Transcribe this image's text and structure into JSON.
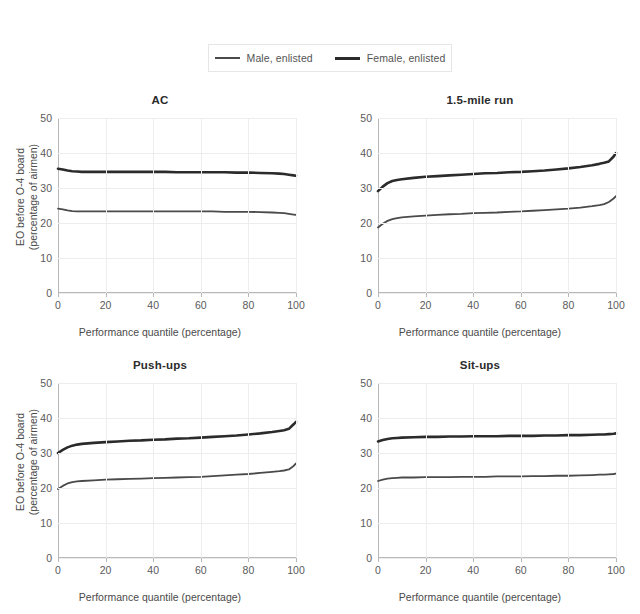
{
  "figure": {
    "background_color": "#ffffff",
    "legend": {
      "position": "top-center",
      "entries": [
        {
          "label": "Male, enlisted",
          "color": "#4a4a4a",
          "swatch": "line-swatch-male",
          "linewidth": 2
        },
        {
          "label": "Female, enlisted",
          "color": "#2b2b2b",
          "swatch": "line-swatch-female",
          "linewidth": 3
        }
      ]
    }
  },
  "chart_data": [
    {
      "type": "line",
      "title": "AC",
      "xlabel": "Performance quantile (percentage)",
      "ylabel": "EO before O-4 board\n(percentage of airmen)",
      "ylabel_line1": "EO before O-4 board",
      "ylabel_line2": "(percentage of airmen)",
      "xlim": [
        0,
        100
      ],
      "ylim": [
        0,
        50
      ],
      "xticks": [
        0,
        20,
        40,
        60,
        80,
        100
      ],
      "yticks": [
        0,
        10,
        20,
        30,
        40,
        50
      ],
      "grid": true,
      "x": [
        0,
        2,
        4,
        6,
        8,
        10,
        15,
        20,
        25,
        30,
        35,
        40,
        45,
        50,
        55,
        60,
        65,
        70,
        75,
        80,
        85,
        90,
        93,
        95,
        97,
        99,
        100
      ],
      "series": [
        {
          "name": "Male, enlisted",
          "color": "#4a4a4a",
          "values": [
            24.1,
            23.9,
            23.6,
            23.4,
            23.3,
            23.3,
            23.3,
            23.3,
            23.3,
            23.3,
            23.3,
            23.3,
            23.3,
            23.3,
            23.3,
            23.3,
            23.3,
            23.2,
            23.2,
            23.2,
            23.1,
            23.0,
            22.9,
            22.8,
            22.6,
            22.4,
            22.3
          ]
        },
        {
          "name": "Female, enlisted",
          "color": "#2b2b2b",
          "values": [
            35.5,
            35.3,
            35.0,
            34.8,
            34.7,
            34.6,
            34.6,
            34.6,
            34.6,
            34.6,
            34.6,
            34.6,
            34.6,
            34.5,
            34.5,
            34.5,
            34.5,
            34.5,
            34.4,
            34.4,
            34.3,
            34.2,
            34.1,
            34.0,
            33.8,
            33.6,
            33.5
          ]
        }
      ]
    },
    {
      "type": "line",
      "title": "1.5-mile run",
      "xlabel": "Performance quantile (percentage)",
      "ylabel": "EO before O-4 board\n(percentage of airmen)",
      "ylabel_line1": "EO before O-4 board",
      "ylabel_line2": "(percentage of airmen)",
      "xlim": [
        0,
        100
      ],
      "ylim": [
        0,
        50
      ],
      "xticks": [
        0,
        20,
        40,
        60,
        80,
        100
      ],
      "yticks": [
        0,
        10,
        20,
        30,
        40,
        50
      ],
      "grid": true,
      "x": [
        0,
        2,
        4,
        6,
        8,
        10,
        15,
        20,
        25,
        30,
        35,
        40,
        45,
        50,
        55,
        60,
        65,
        70,
        75,
        80,
        85,
        90,
        93,
        95,
        97,
        99,
        100
      ],
      "series": [
        {
          "name": "Male, enlisted",
          "color": "#4a4a4a",
          "values": [
            18.7,
            19.8,
            20.6,
            21.1,
            21.4,
            21.6,
            21.9,
            22.1,
            22.3,
            22.5,
            22.6,
            22.8,
            22.9,
            23.0,
            23.2,
            23.3,
            23.5,
            23.7,
            23.9,
            24.1,
            24.4,
            24.8,
            25.1,
            25.4,
            26.0,
            27.0,
            27.7
          ]
        },
        {
          "name": "Female, enlisted",
          "color": "#2b2b2b",
          "values": [
            29.1,
            30.4,
            31.4,
            32.0,
            32.3,
            32.5,
            32.9,
            33.2,
            33.4,
            33.6,
            33.8,
            34.0,
            34.2,
            34.3,
            34.5,
            34.6,
            34.8,
            35.0,
            35.3,
            35.6,
            36.0,
            36.5,
            36.9,
            37.2,
            37.6,
            39.0,
            40.0
          ]
        }
      ]
    },
    {
      "type": "line",
      "title": "Push-ups",
      "xlabel": "Performance quantile (percentage)",
      "ylabel": "EO before O-4 board\n(percentage of airmen)",
      "ylabel_line1": "EO before O-4 board",
      "ylabel_line2": "(percentage of airmen)",
      "xlim": [
        0,
        100
      ],
      "ylim": [
        0,
        50
      ],
      "xticks": [
        0,
        20,
        40,
        60,
        80,
        100
      ],
      "yticks": [
        0,
        10,
        20,
        30,
        40,
        50
      ],
      "grid": true,
      "x": [
        0,
        2,
        4,
        6,
        8,
        10,
        15,
        20,
        25,
        30,
        35,
        40,
        45,
        50,
        55,
        60,
        65,
        70,
        75,
        80,
        85,
        90,
        93,
        95,
        97,
        99,
        100
      ],
      "series": [
        {
          "name": "Male, enlisted",
          "color": "#4a4a4a",
          "values": [
            19.7,
            20.6,
            21.3,
            21.7,
            21.9,
            22.0,
            22.2,
            22.4,
            22.5,
            22.6,
            22.7,
            22.8,
            22.9,
            23.0,
            23.1,
            23.2,
            23.4,
            23.6,
            23.8,
            24.0,
            24.3,
            24.6,
            24.8,
            25.0,
            25.3,
            26.3,
            27.0
          ]
        },
        {
          "name": "Female, enlisted",
          "color": "#2b2b2b",
          "values": [
            30.0,
            30.9,
            31.6,
            32.1,
            32.4,
            32.6,
            32.9,
            33.1,
            33.3,
            33.5,
            33.6,
            33.8,
            33.9,
            34.1,
            34.2,
            34.4,
            34.6,
            34.8,
            35.0,
            35.3,
            35.6,
            36.0,
            36.3,
            36.5,
            36.9,
            38.2,
            38.9
          ]
        }
      ]
    },
    {
      "type": "line",
      "title": "Sit-ups",
      "xlabel": "Performance quantile (percentage)",
      "ylabel": "EO before O-4 board\n(percentage of airmen)",
      "ylabel_line1": "EO before O-4 board",
      "ylabel_line2": "(percentage of airmen)",
      "xlim": [
        0,
        100
      ],
      "ylim": [
        0,
        50
      ],
      "xticks": [
        0,
        20,
        40,
        60,
        80,
        100
      ],
      "yticks": [
        0,
        10,
        20,
        30,
        40,
        50
      ],
      "grid": true,
      "x": [
        0,
        2,
        4,
        6,
        8,
        10,
        15,
        20,
        25,
        30,
        35,
        40,
        45,
        50,
        55,
        60,
        65,
        70,
        75,
        80,
        85,
        90,
        93,
        95,
        97,
        99,
        100
      ],
      "series": [
        {
          "name": "Male, enlisted",
          "color": "#4a4a4a",
          "values": [
            22.0,
            22.4,
            22.7,
            22.8,
            22.9,
            23.0,
            23.0,
            23.1,
            23.1,
            23.1,
            23.2,
            23.2,
            23.2,
            23.3,
            23.3,
            23.3,
            23.4,
            23.4,
            23.5,
            23.5,
            23.6,
            23.7,
            23.8,
            23.8,
            23.9,
            24.0,
            24.1
          ]
        },
        {
          "name": "Female, enlisted",
          "color": "#2b2b2b",
          "values": [
            33.3,
            33.7,
            34.0,
            34.2,
            34.3,
            34.4,
            34.5,
            34.6,
            34.6,
            34.7,
            34.7,
            34.8,
            34.8,
            34.8,
            34.9,
            34.9,
            34.9,
            35.0,
            35.0,
            35.1,
            35.1,
            35.2,
            35.3,
            35.3,
            35.4,
            35.5,
            35.6
          ]
        }
      ]
    }
  ]
}
